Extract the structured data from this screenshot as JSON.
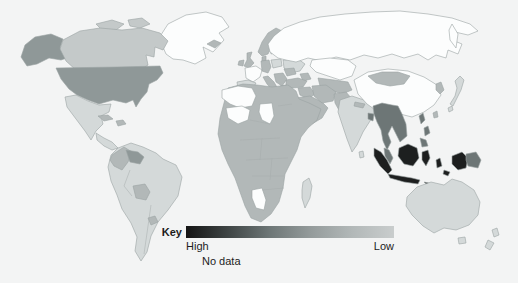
{
  "figure": {
    "type": "choropleth-world-map",
    "background": "#f3f4f4"
  },
  "palette": {
    "highest": "#1d1f1f",
    "very_high": "#6d7676",
    "high": "#8f9898",
    "medium": "#b2b8b8",
    "medium_low": "#c4c9c9",
    "low": "#d4d9d9",
    "lowest": "#e2e5e5",
    "no_data": "#fcfdfd",
    "border": "#9aa2a2",
    "ocean": "#f3f4f4"
  },
  "legend": {
    "key_label": "Key",
    "high_label": "High",
    "low_label": "Low",
    "no_data_label": "No data",
    "gradient_stops": [
      "#141414",
      "#3e4444",
      "#6d7676",
      "#949b9b",
      "#b2b8b8",
      "#c9cdcd"
    ]
  },
  "map_data": {
    "type": "choropleth",
    "scale": "High (dark) to Low (light); white = no data",
    "regions": [
      {
        "name": "United States (incl. Alaska)",
        "level": "high"
      },
      {
        "name": "Canada",
        "level": "medium_low"
      },
      {
        "name": "Greenland",
        "level": "no_data"
      },
      {
        "name": "Mexico",
        "level": "low"
      },
      {
        "name": "Central America",
        "level": "low"
      },
      {
        "name": "Cuba / Hispaniola",
        "level": "medium"
      },
      {
        "name": "Colombia",
        "level": "medium"
      },
      {
        "name": "Venezuela",
        "level": "high"
      },
      {
        "name": "Bolivia",
        "level": "medium"
      },
      {
        "name": "Uruguay",
        "level": "medium"
      },
      {
        "name": "Brazil / rest of South America",
        "level": "low"
      },
      {
        "name": "United Kingdom / Ireland",
        "level": "medium"
      },
      {
        "name": "Norway",
        "level": "medium"
      },
      {
        "name": "Sweden",
        "level": "low"
      },
      {
        "name": "Finland",
        "level": "lowest"
      },
      {
        "name": "France",
        "level": "no_data"
      },
      {
        "name": "Iberia",
        "level": "low"
      },
      {
        "name": "Germany / Central Europe",
        "level": "medium"
      },
      {
        "name": "Poland / Ukraine",
        "level": "low"
      },
      {
        "name": "Italy / Balkans",
        "level": "medium"
      },
      {
        "name": "Russia",
        "level": "no_data"
      },
      {
        "name": "Kazakhstan",
        "level": "no_data"
      },
      {
        "name": "Central Asia",
        "level": "medium"
      },
      {
        "name": "Turkey / Middle East / Arabia / Iran",
        "level": "medium"
      },
      {
        "name": "India",
        "level": "low"
      },
      {
        "name": "China",
        "level": "no_data"
      },
      {
        "name": "Mongolia",
        "level": "medium"
      },
      {
        "name": "Korea",
        "level": "medium"
      },
      {
        "name": "Japan",
        "level": "low"
      },
      {
        "name": "Indochina (Myanmar/Thailand/Vietnam)",
        "level": "very_high"
      },
      {
        "name": "Philippines",
        "level": "very_high"
      },
      {
        "name": "Indonesia",
        "level": "highest"
      },
      {
        "name": "Papua New Guinea",
        "level": "very_high"
      },
      {
        "name": "Australia",
        "level": "low"
      },
      {
        "name": "New Zealand",
        "level": "low"
      },
      {
        "name": "Africa (most countries)",
        "level": "medium"
      },
      {
        "name": "Morocco / Algeria",
        "level": "no_data"
      },
      {
        "name": "Mali / Mauritania",
        "level": "no_data"
      },
      {
        "name": "Chad",
        "level": "no_data"
      },
      {
        "name": "Namibia",
        "level": "no_data"
      },
      {
        "name": "Madagascar",
        "level": "low"
      },
      {
        "name": "Iceland",
        "level": "medium"
      }
    ]
  }
}
